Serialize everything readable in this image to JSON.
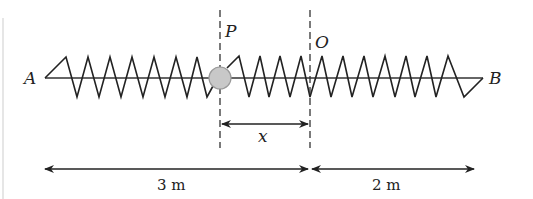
{
  "diagram": {
    "title": "",
    "labels": {
      "left_end": "A",
      "right_end": "B",
      "ball_position": "P",
      "equilibrium": "O",
      "displacement": "x",
      "left_length": "3 m",
      "right_length": "2 m"
    },
    "colors": {
      "line": "#222222",
      "ball_fill": "#c8c8c8",
      "ball_stroke": "#9a9a9a"
    }
  }
}
